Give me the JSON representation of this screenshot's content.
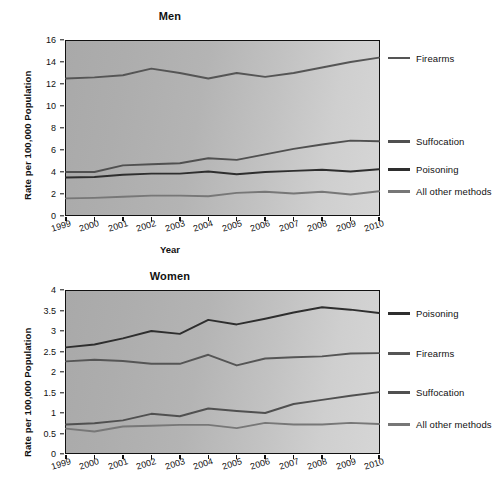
{
  "figure": {
    "colors": {
      "firearms": "#555555",
      "suffocation": "#505050",
      "poisoning": "#2e2e2e",
      "all_other": "#777777",
      "axis": "#111111",
      "plot_background_light": "#d6d6d6",
      "plot_background_dark": "#a9a9a9"
    }
  },
  "panels": [
    {
      "id": "men",
      "title": "Men",
      "ylabel": "Rate per 100,000 Population",
      "xlabel": "Year",
      "legend": [
        {
          "label": "Firearms",
          "color": "#555555"
        },
        {
          "label": "Suffocation",
          "color": "#505050"
        },
        {
          "label": "Poisoning",
          "color": "#2e2e2e"
        },
        {
          "label": "All other methods",
          "color": "#777777"
        }
      ]
    },
    {
      "id": "women",
      "title": "Women",
      "ylabel": "Rate per 100,000 Population",
      "xlabel": "",
      "legend": [
        {
          "label": "Poisoning",
          "color": "#2e2e2e"
        },
        {
          "label": "Firearms",
          "color": "#555555"
        },
        {
          "label": "Suffocation",
          "color": "#505050"
        },
        {
          "label": "All other methods",
          "color": "#777777"
        }
      ]
    }
  ],
  "chart_data": [
    {
      "type": "line",
      "title": "Men",
      "xlabel": "Year",
      "ylabel": "Rate per 100,000 Population",
      "categories": [
        "1999",
        "2000",
        "2001",
        "2002",
        "2003",
        "2004",
        "2005",
        "2006",
        "2007",
        "2008",
        "2009",
        "2010"
      ],
      "ylim": [
        0,
        16
      ],
      "yticks": [
        0,
        2,
        4,
        6,
        8,
        10,
        12,
        14,
        16
      ],
      "ytick_labels": [
        "0",
        "2",
        "4",
        "6",
        "8",
        "10",
        "12",
        "14",
        "16"
      ],
      "grid": false,
      "legend_position": "right",
      "series": [
        {
          "name": "Firearms",
          "color": "#555555",
          "values": [
            12.5,
            12.6,
            12.8,
            13.4,
            13.0,
            12.5,
            13.0,
            12.65,
            13.0,
            13.5,
            14.0,
            14.4
          ]
        },
        {
          "name": "Suffocation",
          "color": "#505050",
          "values": [
            4.0,
            4.0,
            4.6,
            4.7,
            4.8,
            5.25,
            5.1,
            5.6,
            6.1,
            6.5,
            6.85,
            6.8
          ]
        },
        {
          "name": "Poisoning",
          "color": "#2e2e2e",
          "values": [
            3.5,
            3.55,
            3.75,
            3.85,
            3.85,
            4.05,
            3.8,
            4.0,
            4.1,
            4.2,
            4.05,
            4.25
          ]
        },
        {
          "name": "All other methods",
          "color": "#777777",
          "values": [
            1.6,
            1.65,
            1.75,
            1.85,
            1.85,
            1.8,
            2.1,
            2.2,
            2.05,
            2.2,
            1.95,
            2.25
          ]
        }
      ]
    },
    {
      "type": "line",
      "title": "Women",
      "xlabel": "",
      "ylabel": "Rate per 100,000 Population",
      "categories": [
        "1999",
        "2000",
        "2001",
        "2002",
        "2003",
        "2004",
        "2005",
        "2006",
        "2007",
        "2008",
        "2009",
        "2010"
      ],
      "ylim": [
        0,
        4
      ],
      "yticks": [
        0,
        0.5,
        1,
        1.5,
        2,
        2.5,
        3,
        3.5,
        4
      ],
      "ytick_labels": [
        "0",
        "0.5",
        "1",
        "1.5",
        "2",
        "2.5",
        "3",
        "3.5",
        "4"
      ],
      "grid": false,
      "legend_position": "right",
      "series": [
        {
          "name": "Poisoning",
          "color": "#2e2e2e",
          "values": [
            2.6,
            2.67,
            2.82,
            3.0,
            2.93,
            3.27,
            3.16,
            3.3,
            3.45,
            3.58,
            3.52,
            3.44
          ]
        },
        {
          "name": "Firearms",
          "color": "#555555",
          "values": [
            2.26,
            2.3,
            2.27,
            2.2,
            2.2,
            2.42,
            2.16,
            2.33,
            2.36,
            2.38,
            2.45,
            2.46
          ]
        },
        {
          "name": "Suffocation",
          "color": "#505050",
          "values": [
            0.72,
            0.75,
            0.82,
            0.98,
            0.92,
            1.11,
            1.05,
            1.0,
            1.22,
            1.32,
            1.42,
            1.51
          ]
        },
        {
          "name": "All other methods",
          "color": "#777777",
          "values": [
            0.62,
            0.55,
            0.67,
            0.69,
            0.71,
            0.71,
            0.63,
            0.76,
            0.72,
            0.72,
            0.76,
            0.73
          ]
        }
      ]
    }
  ]
}
